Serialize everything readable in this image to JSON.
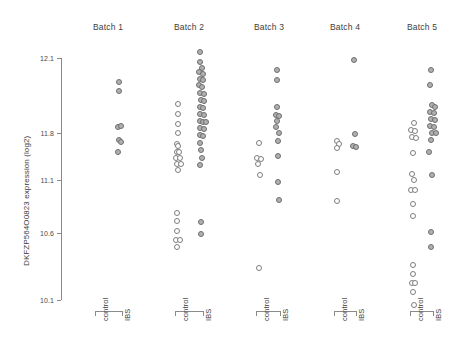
{
  "chart_data": {
    "type": "scatter",
    "title": "",
    "xlabel": "",
    "ylabel": "DKFZP564O0823 expression (log2)",
    "grid": false,
    "legend": "none",
    "ylim": [
      10.1,
      12.1
    ],
    "ytick_labels": [
      "12.1",
      "11.8",
      "11.1",
      "10.6",
      "10.1"
    ],
    "ytick_values": [
      12.1,
      11.8,
      11.1,
      10.6,
      10.1
    ],
    "ytick_pixel_y": [
      58,
      133,
      180,
      233,
      300
    ],
    "panel_labels": [
      "Batch 1",
      "Batch 2",
      "Batch 3",
      "Batch 4",
      "Batch 5"
    ],
    "group_labels": [
      "control",
      "IBS"
    ],
    "panels": [
      {
        "label": "Batch 1",
        "center_x": 108,
        "groups": [
          {
            "name": "control",
            "x": 98,
            "points": []
          },
          {
            "name": "IBS",
            "x": 120,
            "points": [
              {
                "x": 119,
                "y": 82,
                "style": "fill"
              },
              {
                "x": 119,
                "y": 91,
                "style": "fill"
              },
              {
                "x": 118,
                "y": 127,
                "style": "fill"
              },
              {
                "x": 121,
                "y": 126,
                "style": "fill"
              },
              {
                "x": 119,
                "y": 140,
                "style": "fill"
              },
              {
                "x": 121,
                "y": 142,
                "style": "fill"
              },
              {
                "x": 118,
                "y": 152,
                "style": "fill"
              }
            ]
          }
        ]
      },
      {
        "label": "Batch 2",
        "center_x": 189,
        "groups": [
          {
            "name": "control",
            "x": 178,
            "points": [
              {
                "x": 178,
                "y": 104,
                "style": "open"
              },
              {
                "x": 178,
                "y": 114,
                "style": "open"
              },
              {
                "x": 178,
                "y": 124,
                "style": "open"
              },
              {
                "x": 178,
                "y": 133,
                "style": "open"
              },
              {
                "x": 177,
                "y": 144,
                "style": "open"
              },
              {
                "x": 178,
                "y": 146,
                "style": "open"
              },
              {
                "x": 177,
                "y": 152,
                "style": "open"
              },
              {
                "x": 179,
                "y": 152,
                "style": "open"
              },
              {
                "x": 176,
                "y": 158,
                "style": "open"
              },
              {
                "x": 180,
                "y": 158,
                "style": "open"
              },
              {
                "x": 177,
                "y": 164,
                "style": "open"
              },
              {
                "x": 181,
                "y": 164,
                "style": "open"
              },
              {
                "x": 178,
                "y": 170,
                "style": "open"
              },
              {
                "x": 177,
                "y": 213,
                "style": "open"
              },
              {
                "x": 177,
                "y": 221,
                "style": "open"
              },
              {
                "x": 177,
                "y": 231,
                "style": "open"
              },
              {
                "x": 176,
                "y": 240,
                "style": "open"
              },
              {
                "x": 180,
                "y": 240,
                "style": "open"
              },
              {
                "x": 177,
                "y": 247,
                "style": "open"
              }
            ]
          },
          {
            "name": "IBS",
            "x": 201,
            "points": [
              {
                "x": 200,
                "y": 52,
                "style": "fill"
              },
              {
                "x": 200,
                "y": 62,
                "style": "fill"
              },
              {
                "x": 202,
                "y": 68,
                "style": "fill"
              },
              {
                "x": 199,
                "y": 72,
                "style": "fill"
              },
              {
                "x": 203,
                "y": 74,
                "style": "fill"
              },
              {
                "x": 200,
                "y": 79,
                "style": "fill"
              },
              {
                "x": 203,
                "y": 80,
                "style": "fill"
              },
              {
                "x": 199,
                "y": 85,
                "style": "fill"
              },
              {
                "x": 202,
                "y": 87,
                "style": "fill"
              },
              {
                "x": 200,
                "y": 93,
                "style": "fill"
              },
              {
                "x": 204,
                "y": 94,
                "style": "fill"
              },
              {
                "x": 201,
                "y": 100,
                "style": "fill"
              },
              {
                "x": 204,
                "y": 101,
                "style": "fill"
              },
              {
                "x": 200,
                "y": 107,
                "style": "fill"
              },
              {
                "x": 203,
                "y": 108,
                "style": "fill"
              },
              {
                "x": 200,
                "y": 114,
                "style": "fill"
              },
              {
                "x": 204,
                "y": 115,
                "style": "fill"
              },
              {
                "x": 200,
                "y": 121,
                "style": "fill"
              },
              {
                "x": 203,
                "y": 122,
                "style": "fill"
              },
              {
                "x": 206,
                "y": 122,
                "style": "fill"
              },
              {
                "x": 200,
                "y": 128,
                "style": "fill"
              },
              {
                "x": 204,
                "y": 129,
                "style": "fill"
              },
              {
                "x": 200,
                "y": 135,
                "style": "fill"
              },
              {
                "x": 203,
                "y": 136,
                "style": "fill"
              },
              {
                "x": 200,
                "y": 143,
                "style": "fill"
              },
              {
                "x": 201,
                "y": 150,
                "style": "fill"
              },
              {
                "x": 202,
                "y": 158,
                "style": "fill"
              },
              {
                "x": 200,
                "y": 165,
                "style": "fill"
              },
              {
                "x": 201,
                "y": 222,
                "style": "fill"
              },
              {
                "x": 201,
                "y": 234,
                "style": "fill"
              }
            ]
          }
        ]
      },
      {
        "label": "Batch 3",
        "center_x": 269,
        "groups": [
          {
            "name": "control",
            "x": 259,
            "points": [
              {
                "x": 259,
                "y": 143,
                "style": "open"
              },
              {
                "x": 257,
                "y": 158,
                "style": "open"
              },
              {
                "x": 261,
                "y": 159,
                "style": "open"
              },
              {
                "x": 258,
                "y": 164,
                "style": "open"
              },
              {
                "x": 260,
                "y": 175,
                "style": "open"
              },
              {
                "x": 259,
                "y": 268,
                "style": "open"
              }
            ]
          },
          {
            "name": "IBS",
            "x": 278,
            "points": [
              {
                "x": 277,
                "y": 70,
                "style": "fill"
              },
              {
                "x": 277,
                "y": 80,
                "style": "fill"
              },
              {
                "x": 277,
                "y": 107,
                "style": "fill"
              },
              {
                "x": 276,
                "y": 115,
                "style": "fill"
              },
              {
                "x": 279,
                "y": 116,
                "style": "fill"
              },
              {
                "x": 277,
                "y": 121,
                "style": "fill"
              },
              {
                "x": 276,
                "y": 127,
                "style": "fill"
              },
              {
                "x": 279,
                "y": 133,
                "style": "fill"
              },
              {
                "x": 278,
                "y": 141,
                "style": "fill"
              },
              {
                "x": 278,
                "y": 156,
                "style": "fill"
              },
              {
                "x": 278,
                "y": 182,
                "style": "fill"
              },
              {
                "x": 279,
                "y": 200,
                "style": "fill"
              }
            ]
          }
        ]
      },
      {
        "label": "Batch 4",
        "center_x": 345,
        "groups": [
          {
            "name": "control",
            "x": 337,
            "points": [
              {
                "x": 337,
                "y": 141,
                "style": "open"
              },
              {
                "x": 339,
                "y": 144,
                "style": "open"
              },
              {
                "x": 337,
                "y": 148,
                "style": "open"
              },
              {
                "x": 337,
                "y": 172,
                "style": "open"
              },
              {
                "x": 337,
                "y": 201,
                "style": "open"
              }
            ]
          },
          {
            "name": "IBS",
            "x": 354,
            "points": [
              {
                "x": 354,
                "y": 60,
                "style": "fill"
              },
              {
                "x": 355,
                "y": 134,
                "style": "fill"
              },
              {
                "x": 353,
                "y": 146,
                "style": "fill"
              },
              {
                "x": 356,
                "y": 147,
                "style": "fill"
              }
            ]
          }
        ]
      },
      {
        "label": "Batch 5",
        "center_x": 422,
        "groups": [
          {
            "name": "control",
            "x": 413,
            "points": [
              {
                "x": 414,
                "y": 123,
                "style": "open"
              },
              {
                "x": 411,
                "y": 130,
                "style": "open"
              },
              {
                "x": 415,
                "y": 131,
                "style": "open"
              },
              {
                "x": 412,
                "y": 137,
                "style": "open"
              },
              {
                "x": 416,
                "y": 138,
                "style": "open"
              },
              {
                "x": 413,
                "y": 153,
                "style": "open"
              },
              {
                "x": 412,
                "y": 174,
                "style": "open"
              },
              {
                "x": 414,
                "y": 180,
                "style": "open"
              },
              {
                "x": 411,
                "y": 190,
                "style": "open"
              },
              {
                "x": 415,
                "y": 190,
                "style": "open"
              },
              {
                "x": 413,
                "y": 204,
                "style": "open"
              },
              {
                "x": 413,
                "y": 216,
                "style": "open"
              },
              {
                "x": 413,
                "y": 265,
                "style": "open"
              },
              {
                "x": 413,
                "y": 274,
                "style": "open"
              },
              {
                "x": 412,
                "y": 283,
                "style": "open"
              },
              {
                "x": 415,
                "y": 283,
                "style": "open"
              },
              {
                "x": 413,
                "y": 292,
                "style": "open"
              },
              {
                "x": 414,
                "y": 305,
                "style": "open"
              }
            ]
          },
          {
            "name": "IBS",
            "x": 431,
            "points": [
              {
                "x": 431,
                "y": 70,
                "style": "fill"
              },
              {
                "x": 430,
                "y": 85,
                "style": "fill"
              },
              {
                "x": 432,
                "y": 105,
                "style": "fill"
              },
              {
                "x": 435,
                "y": 107,
                "style": "fill"
              },
              {
                "x": 430,
                "y": 112,
                "style": "fill"
              },
              {
                "x": 434,
                "y": 113,
                "style": "fill"
              },
              {
                "x": 431,
                "y": 119,
                "style": "fill"
              },
              {
                "x": 435,
                "y": 120,
                "style": "fill"
              },
              {
                "x": 430,
                "y": 126,
                "style": "fill"
              },
              {
                "x": 434,
                "y": 127,
                "style": "fill"
              },
              {
                "x": 432,
                "y": 133,
                "style": "fill"
              },
              {
                "x": 436,
                "y": 133,
                "style": "fill"
              },
              {
                "x": 431,
                "y": 140,
                "style": "fill"
              },
              {
                "x": 429,
                "y": 152,
                "style": "fill"
              },
              {
                "x": 432,
                "y": 175,
                "style": "fill"
              },
              {
                "x": 431,
                "y": 232,
                "style": "fill"
              },
              {
                "x": 431,
                "y": 247,
                "style": "fill"
              }
            ]
          }
        ]
      }
    ]
  }
}
